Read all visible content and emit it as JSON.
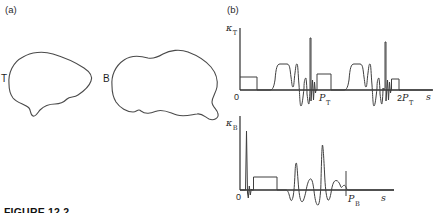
{
  "figure": {
    "caption": "FIGURE 12.2"
  },
  "panel_a": {
    "label": "(a)",
    "shapes": [
      {
        "label": "T"
      },
      {
        "label": "B"
      }
    ]
  },
  "panel_b": {
    "label": "(b)",
    "top_plot": {
      "y_symbol": "κ",
      "y_sub": "T",
      "origin": "0",
      "mark1": "P",
      "mark1_sub": "T",
      "mark2_prefix": "2",
      "mark2": "P",
      "mark2_sub": "T",
      "x_label": "s"
    },
    "bottom_plot": {
      "y_symbol": "κ",
      "y_sub": "B",
      "origin": "0",
      "mark1": "P",
      "mark1_sub": "B",
      "x_label": "s"
    }
  },
  "colors": {
    "line": "#3f3f3f",
    "axis": "#2e2e2e",
    "text": "#1f1f1f",
    "background": "#ffffff"
  }
}
